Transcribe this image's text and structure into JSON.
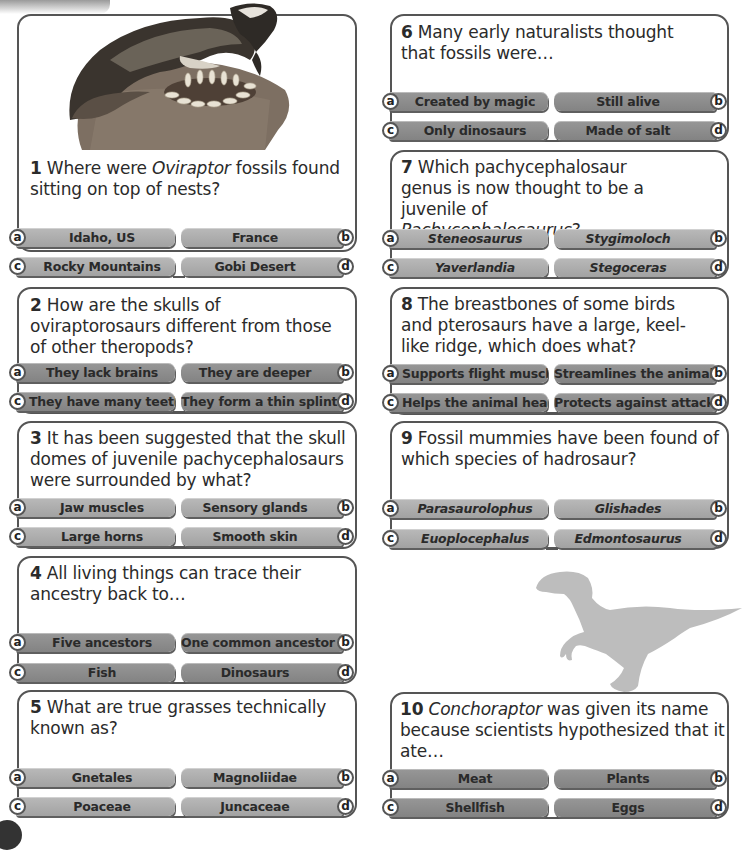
{
  "page": {
    "background": "#ffffff",
    "colors": {
      "card_border": "#555555",
      "option_light": "#a7a7a7",
      "option_dark": "#8a8a8a",
      "silhouette": "#bdbdbd",
      "text": "#2b2b2b"
    }
  },
  "questions": [
    {
      "number": "1",
      "text_parts": [
        "Where were ",
        "Oviraptor",
        " fossils found sitting on top of nests?"
      ],
      "italic_part": 1,
      "image": "oviraptor-on-nest-illustration",
      "options": {
        "a": "Idaho, US",
        "b": "France",
        "c": "Rocky Mountains",
        "d": "Gobi Desert"
      },
      "tone": "light"
    },
    {
      "number": "2",
      "text": "How are the skulls of oviraptorosaurs different from those of other theropods?",
      "options": {
        "a": "They lack brains",
        "b": "They are deeper",
        "c": "They have many teeth",
        "d": "They form a thin splint"
      },
      "tone": "dark"
    },
    {
      "number": "3",
      "text": "It has been suggested that the skull domes of juvenile pachycephalosaurs were surrounded by what?",
      "options": {
        "a": "Jaw muscles",
        "b": "Sensory glands",
        "c": "Large horns",
        "d": "Smooth skin"
      },
      "tone": "light"
    },
    {
      "number": "4",
      "text": "All living things can trace their ancestry back to…",
      "options": {
        "a": "Five ancestors",
        "b": "One common ancestor",
        "c": "Fish",
        "d": "Dinosaurs"
      },
      "tone": "dark"
    },
    {
      "number": "5",
      "text": "What are true grasses technically known as?",
      "options": {
        "a": "Gnetales",
        "b": "Magnoliidae",
        "c": "Poaceae",
        "d": "Juncaceae"
      },
      "tone": "light"
    },
    {
      "number": "6",
      "text": "Many early naturalists thought that fossils were…",
      "options": {
        "a": "Created by magic",
        "b": "Still alive",
        "c": "Only dinosaurs",
        "d": "Made of salt"
      },
      "tone": "dark"
    },
    {
      "number": "7",
      "text_parts": [
        "Which pachycephalosaur genus is now thought to be a juvenile of ",
        "Pachycephalosaurus",
        "?"
      ],
      "italic_part": 1,
      "options": {
        "a": "Steneosaurus",
        "b": "Stygimoloch",
        "c": "Yaverlandia",
        "d": "Stegoceras"
      },
      "options_italic": true,
      "tone": "light"
    },
    {
      "number": "8",
      "text": "The breastbones of some birds and pterosaurs have a large, keel-like ridge, which does what?",
      "options": {
        "a": "Supports flight muscles",
        "b": "Streamlines the animal",
        "c": "Helps the animal hear",
        "d": "Protects against attack"
      },
      "tone": "dark"
    },
    {
      "number": "9",
      "text": "Fossil mummies have been found of which species of hadrosaur?",
      "options": {
        "a": "Parasaurolophus",
        "b": "Glishades",
        "c": "Euoplocephalus",
        "d": "Edmontosaurus"
      },
      "options_italic": true,
      "tone": "light"
    },
    {
      "number": "10",
      "text_parts": [
        "",
        "Conchoraptor",
        " was given its name because scientists hypothesized that it ate…"
      ],
      "italic_part": 1,
      "image": "theropod-silhouette",
      "options": {
        "a": "Meat",
        "b": "Plants",
        "c": "Shellfish",
        "d": "Eggs"
      },
      "tone": "dark"
    }
  ],
  "letters": {
    "a": "a",
    "b": "b",
    "c": "c",
    "d": "d"
  }
}
